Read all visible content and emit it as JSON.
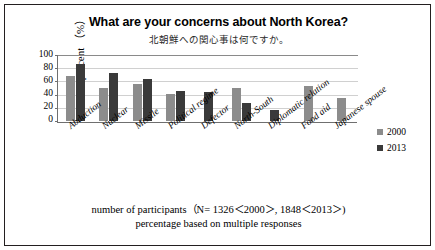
{
  "title_en": "What are your concerns about North Korea?",
  "title_jp": "北朝鮮への関心事は何ですか。",
  "footer": {
    "line1": "number of participants（N= 1326＜2000＞, 1848＜2013＞)",
    "line2": "percentage based on multiple responses"
  },
  "legend": {
    "items": [
      {
        "label": "2000",
        "color": "#8c8c8c"
      },
      {
        "label": "2013",
        "color": "#3a3a3a"
      }
    ]
  },
  "chart_data": {
    "type": "bar",
    "title": "What are your concerns about North Korea?",
    "subtitle": "北朝鮮への関心事は何ですか。",
    "xlabel": "",
    "ylabel": "percent （%）",
    "ylim": [
      0,
      100
    ],
    "yticks": [
      0,
      20,
      40,
      60,
      80,
      100
    ],
    "ytick_labels": [
      "0",
      "20",
      "40",
      "60",
      "80",
      "100"
    ],
    "grid": true,
    "legend_position": "right",
    "categories": [
      "Abduction",
      "Nuclear",
      "Missile",
      "Political regime",
      "Defector",
      "North-South",
      "Diplomatic relation",
      "Food aid",
      "Japanese spouse"
    ],
    "series": [
      {
        "name": "2000",
        "color": "#8c8c8c",
        "values": [
          67,
          50,
          55,
          40,
          0,
          50,
          0,
          52,
          35
        ]
      },
      {
        "name": "2013",
        "color": "#3a3a3a",
        "values": [
          85,
          72,
          62,
          45,
          43,
          27,
          17,
          0,
          0
        ]
      }
    ]
  }
}
